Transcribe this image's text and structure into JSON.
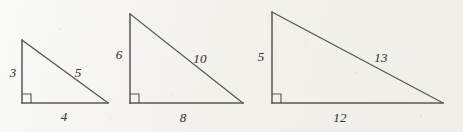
{
  "figure": {
    "canvas": {
      "width": 463,
      "height": 132
    },
    "background_color": "#f2f1ed",
    "stroke_color": "#595754",
    "label_color": "#3d3b39"
  },
  "triangles": [
    {
      "name": "triangle-3-4-5",
      "apex": {
        "x": 22,
        "y": 40
      },
      "bottom_left": {
        "x": 22,
        "y": 103
      },
      "bottom_right": {
        "x": 108,
        "y": 103
      },
      "right_angle_at": "bottom-left",
      "right_angle_marker_size": 9,
      "labels": {
        "vertical_leg": "3",
        "horizontal_leg": "4",
        "hypotenuse": "5"
      },
      "label_positions": {
        "vertical_leg": {
          "x": 13,
          "y": 72
        },
        "horizontal_leg": {
          "x": 64,
          "y": 116
        },
        "hypotenuse": {
          "x": 78,
          "y": 72
        }
      }
    },
    {
      "name": "triangle-6-8-10",
      "apex": {
        "x": 130,
        "y": 14
      },
      "bottom_left": {
        "x": 130,
        "y": 103
      },
      "bottom_right": {
        "x": 243,
        "y": 103
      },
      "right_angle_at": "bottom-left",
      "right_angle_marker_size": 9,
      "labels": {
        "vertical_leg": "6",
        "horizontal_leg": "8",
        "hypotenuse": "10"
      },
      "label_positions": {
        "vertical_leg": {
          "x": 119,
          "y": 54
        },
        "horizontal_leg": {
          "x": 183,
          "y": 117
        },
        "hypotenuse": {
          "x": 200,
          "y": 58
        }
      }
    },
    {
      "name": "triangle-5-12-13",
      "apex": {
        "x": 272,
        "y": 12
      },
      "bottom_left": {
        "x": 272,
        "y": 103
      },
      "bottom_right": {
        "x": 443,
        "y": 103
      },
      "right_angle_at": "bottom-left",
      "right_angle_marker_size": 9,
      "labels": {
        "vertical_leg": "5",
        "horizontal_leg": "12",
        "hypotenuse": "13"
      },
      "label_positions": {
        "vertical_leg": {
          "x": 261,
          "y": 56
        },
        "horizontal_leg": {
          "x": 340,
          "y": 117
        },
        "hypotenuse": {
          "x": 381,
          "y": 57
        }
      }
    }
  ]
}
